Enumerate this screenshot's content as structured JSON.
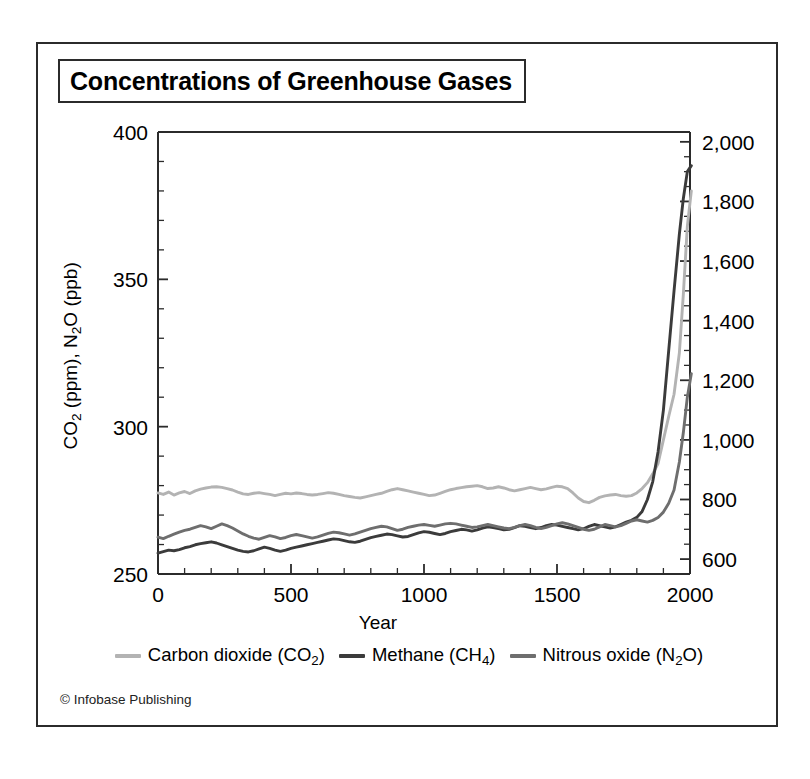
{
  "figure": {
    "title": "Concentrations of Greenhouse Gases",
    "credit": "© Infobase Publishing"
  },
  "colors": {
    "co2": "#b3b3b3",
    "ch4": "#3b3b3b",
    "n2o": "#6e6e6e",
    "axis": "#2b2b2b",
    "frame": "#2b2b2b",
    "background": "#ffffff"
  },
  "chart_data": {
    "type": "line",
    "title": "Concentrations of Greenhouse Gases",
    "xlabel": "Year",
    "ylabel": "CO2 (ppm), N2O (ppb)",
    "ylabel_right": "",
    "grid": false,
    "legend_position": "bottom",
    "xlim": [
      0,
      2000
    ],
    "xticks": [
      0,
      500,
      1000,
      1500,
      2000
    ],
    "xtick_labels": [
      "0",
      "500",
      "1000",
      "1500",
      "2000"
    ],
    "xminor_step": 100,
    "ylim_left": [
      250,
      400
    ],
    "yticks_left": [
      250,
      300,
      350,
      400
    ],
    "ytick_labels_left": [
      "250",
      "300",
      "350",
      "400"
    ],
    "yminor_step_left": 10,
    "ylim_right": [
      550,
      2033
    ],
    "yticks_right": [
      600,
      800,
      1000,
      1200,
      1400,
      1600,
      1800,
      2000
    ],
    "ytick_labels_right": [
      "600",
      "800",
      "1,000",
      "1,200",
      "1,400",
      "1,600",
      "1,800",
      "2,000"
    ],
    "yminor_step_right": 50,
    "series": [
      {
        "name": "Carbon dioxide (CO2)",
        "legend_label": "Carbon dioxide (CO₂)",
        "axis": "left",
        "units": "ppm",
        "color": "#b3b3b3",
        "x": [
          0,
          20,
          40,
          60,
          80,
          100,
          120,
          140,
          160,
          180,
          200,
          220,
          240,
          260,
          280,
          300,
          320,
          340,
          360,
          380,
          400,
          420,
          440,
          460,
          480,
          500,
          520,
          540,
          560,
          580,
          600,
          620,
          640,
          660,
          680,
          700,
          720,
          740,
          760,
          780,
          800,
          820,
          840,
          860,
          880,
          900,
          920,
          940,
          960,
          980,
          1000,
          1020,
          1040,
          1060,
          1080,
          1100,
          1120,
          1140,
          1160,
          1180,
          1200,
          1220,
          1240,
          1260,
          1280,
          1300,
          1320,
          1340,
          1360,
          1380,
          1400,
          1420,
          1440,
          1460,
          1480,
          1500,
          1520,
          1540,
          1560,
          1580,
          1600,
          1620,
          1640,
          1660,
          1680,
          1700,
          1720,
          1740,
          1760,
          1780,
          1800,
          1820,
          1840,
          1860,
          1880,
          1900,
          1920,
          1940,
          1960,
          1975,
          1990,
          2005
        ],
        "y": [
          277.5,
          277.0,
          277.8,
          276.8,
          277.5,
          278.0,
          277.3,
          278.2,
          278.8,
          279.2,
          279.5,
          279.6,
          279.4,
          279.0,
          278.5,
          277.8,
          277.2,
          277.0,
          277.4,
          277.6,
          277.3,
          277.0,
          276.6,
          277.0,
          277.4,
          277.2,
          277.5,
          277.3,
          277.0,
          276.8,
          277.0,
          277.3,
          277.6,
          277.4,
          277.0,
          276.6,
          276.3,
          276.0,
          275.8,
          276.2,
          276.6,
          277.0,
          277.4,
          278.0,
          278.6,
          279.0,
          278.6,
          278.2,
          277.8,
          277.4,
          277.0,
          276.6,
          276.8,
          277.4,
          278.0,
          278.6,
          279.0,
          279.3,
          279.6,
          279.8,
          280.0,
          279.6,
          279.0,
          279.2,
          279.6,
          279.2,
          278.6,
          278.2,
          278.6,
          279.0,
          279.4,
          279.0,
          278.6,
          278.9,
          279.4,
          279.8,
          279.6,
          279.0,
          277.5,
          275.8,
          274.6,
          274.2,
          275.0,
          276.0,
          276.5,
          276.8,
          277.0,
          276.6,
          276.4,
          276.6,
          277.5,
          279.0,
          281.0,
          284.0,
          287.5,
          295.5,
          303.5,
          311.0,
          325.0,
          345.0,
          368.0,
          380.0
        ]
      },
      {
        "name": "Methane (CH4)",
        "legend_label": "Methane (CH₄)",
        "axis": "right",
        "units": "ppb",
        "color": "#3b3b3b",
        "x": [
          0,
          20,
          40,
          60,
          80,
          100,
          120,
          140,
          160,
          180,
          200,
          220,
          240,
          260,
          280,
          300,
          320,
          340,
          360,
          380,
          400,
          420,
          440,
          460,
          480,
          500,
          520,
          540,
          560,
          580,
          600,
          620,
          640,
          660,
          680,
          700,
          720,
          740,
          760,
          780,
          800,
          820,
          840,
          860,
          880,
          900,
          920,
          940,
          960,
          980,
          1000,
          1020,
          1040,
          1060,
          1080,
          1100,
          1120,
          1140,
          1160,
          1180,
          1200,
          1220,
          1240,
          1260,
          1280,
          1300,
          1320,
          1340,
          1360,
          1380,
          1400,
          1420,
          1440,
          1460,
          1480,
          1500,
          1520,
          1540,
          1560,
          1580,
          1600,
          1620,
          1640,
          1660,
          1680,
          1700,
          1720,
          1740,
          1760,
          1780,
          1800,
          1820,
          1840,
          1860,
          1880,
          1900,
          1920,
          1940,
          1960,
          1975,
          1990,
          2005
        ],
        "y": [
          620,
          625,
          630,
          628,
          632,
          638,
          642,
          648,
          652,
          655,
          658,
          654,
          648,
          642,
          636,
          630,
          626,
          624,
          628,
          634,
          640,
          636,
          630,
          626,
          630,
          636,
          640,
          644,
          648,
          652,
          656,
          660,
          664,
          668,
          666,
          662,
          658,
          656,
          660,
          666,
          672,
          676,
          680,
          684,
          682,
          678,
          674,
          676,
          682,
          688,
          692,
          690,
          686,
          682,
          686,
          692,
          696,
          700,
          698,
          694,
          698,
          704,
          708,
          706,
          702,
          698,
          700,
          706,
          712,
          710,
          706,
          702,
          706,
          712,
          716,
          714,
          710,
          706,
          702,
          698,
          702,
          710,
          716,
          712,
          708,
          704,
          708,
          716,
          724,
          730,
          740,
          760,
          800,
          860,
          960,
          1100,
          1300,
          1500,
          1690,
          1810,
          1900,
          1920
        ]
      },
      {
        "name": "Nitrous oxide (N2O)",
        "legend_label": "Nitrous oxide (N₂O)",
        "axis": "left",
        "units": "ppb",
        "color": "#6e6e6e",
        "x": [
          0,
          20,
          40,
          60,
          80,
          100,
          120,
          140,
          160,
          180,
          200,
          220,
          240,
          260,
          280,
          300,
          320,
          340,
          360,
          380,
          400,
          420,
          440,
          460,
          480,
          500,
          520,
          540,
          560,
          580,
          600,
          620,
          640,
          660,
          680,
          700,
          720,
          740,
          760,
          780,
          800,
          820,
          840,
          860,
          880,
          900,
          920,
          940,
          960,
          980,
          1000,
          1020,
          1040,
          1060,
          1080,
          1100,
          1120,
          1140,
          1160,
          1180,
          1200,
          1220,
          1240,
          1260,
          1280,
          1300,
          1320,
          1340,
          1360,
          1380,
          1400,
          1420,
          1440,
          1460,
          1480,
          1500,
          1520,
          1540,
          1560,
          1580,
          1600,
          1620,
          1640,
          1660,
          1680,
          1700,
          1720,
          1740,
          1760,
          1780,
          1800,
          1820,
          1840,
          1860,
          1880,
          1900,
          1920,
          1940,
          1960,
          1975,
          1990,
          2005
        ],
        "y": [
          262.5,
          262.0,
          262.8,
          263.5,
          264.2,
          264.8,
          265.2,
          265.8,
          266.4,
          266.0,
          265.4,
          266.2,
          267.0,
          266.4,
          265.6,
          264.6,
          263.6,
          262.8,
          262.2,
          261.8,
          262.4,
          263.0,
          262.6,
          262.0,
          262.4,
          263.0,
          263.4,
          263.0,
          262.6,
          262.2,
          262.6,
          263.2,
          263.8,
          264.2,
          264.0,
          263.6,
          263.2,
          263.6,
          264.2,
          264.8,
          265.4,
          265.8,
          266.2,
          266.0,
          265.4,
          264.8,
          265.2,
          265.8,
          266.2,
          266.6,
          266.8,
          266.5,
          266.2,
          266.6,
          267.0,
          267.2,
          267.0,
          266.6,
          266.2,
          265.8,
          266.0,
          266.4,
          266.8,
          266.4,
          266.0,
          265.6,
          265.4,
          265.8,
          266.4,
          266.8,
          266.4,
          265.8,
          265.4,
          265.8,
          266.4,
          267.0,
          267.4,
          267.0,
          266.4,
          265.8,
          265.2,
          264.8,
          265.2,
          266.0,
          266.8,
          266.4,
          266.0,
          266.4,
          267.2,
          268.0,
          268.4,
          268.0,
          267.6,
          268.2,
          269.2,
          271.0,
          274.0,
          278.5,
          288.0,
          298.0,
          310.0,
          318.0
        ]
      }
    ]
  }
}
